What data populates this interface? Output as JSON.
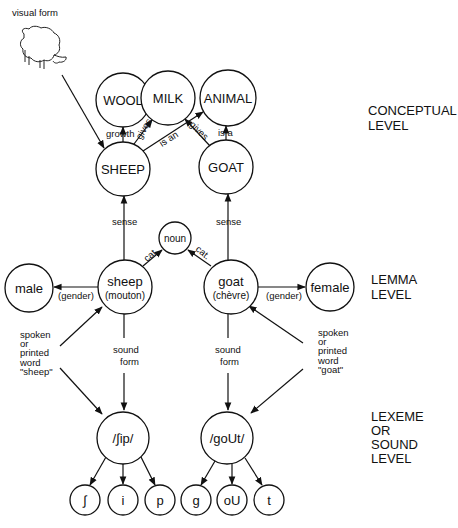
{
  "visual_form_label": "visual form",
  "levels": {
    "conceptual": [
      "CONCEPTUAL",
      "LEVEL"
    ],
    "lemma": [
      "LEMMA",
      "LEVEL"
    ],
    "lexeme": [
      "LEXEME",
      "OR",
      "SOUND",
      "LEVEL"
    ]
  },
  "concepts": {
    "wool": "WOOL",
    "milk": "MILK",
    "animal": "ANIMAL",
    "sheep": "SHEEP",
    "goat": "GOAT"
  },
  "lemmas": {
    "sheep": "sheep",
    "sheep_fr": "(mouton)",
    "goat": "goat",
    "goat_fr": "(chèvre)",
    "noun": "noun",
    "male": "male",
    "female": "female"
  },
  "lexemes": {
    "sheep": "/∫ip/",
    "goat": "/goUt/",
    "phonemes": [
      "∫",
      "i",
      "p",
      "g",
      "oU",
      "t"
    ]
  },
  "edge_labels": {
    "growth": "growth",
    "gives_sheep": "gives",
    "is_an": "is an",
    "gives_goat": "gives",
    "is_a": "is a",
    "sense_sheep": "sense",
    "sense_goat": "sense",
    "cat_sheep": "cat.",
    "cat_goat": "cat.",
    "gender_sheep": "(gender)",
    "gender_goat": "(gender)",
    "sound_form": [
      "sound",
      "form"
    ]
  },
  "input_sheep": [
    "spoken",
    "or",
    "printed",
    "word",
    "\"sheep\""
  ],
  "input_goat": [
    "spoken",
    "or",
    "printed",
    "word",
    "\"goat\""
  ]
}
